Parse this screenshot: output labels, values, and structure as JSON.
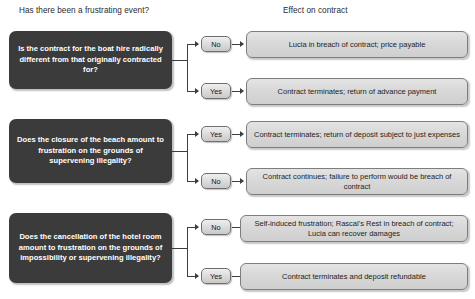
{
  "headers": {
    "left": "Has there been a frustrating event?",
    "right": "Effect on contract"
  },
  "branches": [
    {
      "question": "Is the contract for the boat hire radically different from that originally contracted for?",
      "outcomes": [
        {
          "label": "No",
          "effect": "Lucia in breach of contract; price payable"
        },
        {
          "label": "Yes",
          "effect": "Contract terminates; return of advance payment"
        }
      ]
    },
    {
      "question": "Does the closure of the beach amount to frustration on the grounds of supervening illegality?",
      "outcomes": [
        {
          "label": "Yes",
          "effect": "Contract terminates; return of deposit subject to just expenses"
        },
        {
          "label": "No",
          "effect": "Contract continues; failure to perform would be breach of contract"
        }
      ]
    },
    {
      "question": "Does the cancellation of the hotel room amount to frustration on the grounds of impossibility or supervening illegality?",
      "outcomes": [
        {
          "label": "No",
          "effect": "Self-induced frustration; Rascal's Rest in breach of contract; Lucia can recover damages"
        },
        {
          "label": "Yes",
          "effect": "Contract terminates and deposit refundable"
        }
      ]
    }
  ],
  "colors": {
    "question_box": "#3b3b3b",
    "question_text": "#ffffff",
    "effect_box": "#d8d8d8",
    "effect_border": "#7d7d7d",
    "connector": "#3d3d3d",
    "page_background": "#ffffff"
  }
}
